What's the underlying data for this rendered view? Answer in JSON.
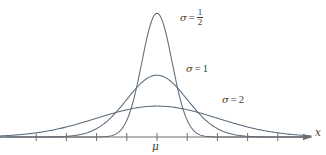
{
  "figure": {
    "background_color": "#ffffff",
    "curve_color": "#5c6b7a",
    "axis_color": "#6e6e6e",
    "text_color": "#3a3a3a"
  },
  "chart_data": {
    "type": "line",
    "title": "",
    "subtitle": "",
    "xlabel": "x",
    "ylabel": "",
    "grid": false,
    "legend_position": "inline-annotations",
    "xlim": [
      -5,
      5
    ],
    "ylim": [
      0,
      0.88
    ],
    "x_axis": {
      "label": "x",
      "center_tick_label": "μ",
      "arrow": true,
      "tick_values": [
        -4,
        -3,
        -2,
        -1,
        0,
        1,
        2,
        3,
        4
      ],
      "tick_labels": [
        "",
        "",
        "",
        "",
        "μ",
        "",
        "",
        "",
        ""
      ]
    },
    "series": [
      {
        "name": "sigma-half",
        "label_sigma": "σ",
        "label_equals": "=",
        "label_value_numerator": "1",
        "label_value_denominator": "2",
        "label_text": "σ = 1/2",
        "sigma": 0.5,
        "mu": 0,
        "peak_value": 0.798
      },
      {
        "name": "sigma-one",
        "label_sigma": "σ",
        "label_equals": "=",
        "label_value": "1",
        "label_text": "σ = 1",
        "sigma": 1,
        "mu": 0,
        "peak_value": 0.399
      },
      {
        "name": "sigma-two",
        "label_sigma": "σ",
        "label_equals": "=",
        "label_value": "2",
        "label_text": "σ = 2",
        "sigma": 2,
        "mu": 0,
        "peak_value": 0.199
      }
    ]
  }
}
